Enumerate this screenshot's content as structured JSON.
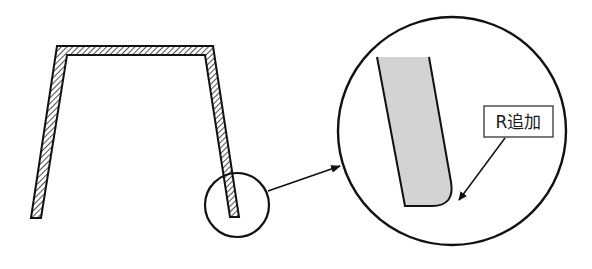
{
  "diagram": {
    "type": "technical-drawing",
    "main_part": {
      "name": "hat-section-profile",
      "fill": "hatched"
    },
    "detail_marker": {
      "name": "detail-circle-small"
    },
    "detail_view": {
      "name": "detail-circle-large",
      "part_fill_color": "#d3d3d3"
    },
    "callout": {
      "label": "R追加"
    },
    "colors": {
      "stroke": "#111111",
      "background": "#ffffff",
      "detail_fill": "#d3d3d3"
    }
  }
}
